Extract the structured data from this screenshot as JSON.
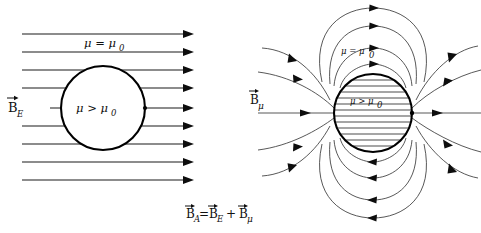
{
  "figure": {
    "background_color": "#ffffff",
    "line_color": "#1a1a1a",
    "thin_line_color": "#3a3a3a",
    "sphere_stroke_color": "#000000"
  },
  "left_panel": {
    "name": "external-uniform-field-panel",
    "field_label": {
      "symbol": "B",
      "subscript": "E",
      "vector_arrow": "→",
      "full": "B⃗E"
    },
    "outside_medium_label": "μ = μ",
    "outside_medium_subscript": "0",
    "outside_medium_full": "μ = μ₀",
    "inside_medium_label": "μ > μ",
    "inside_medium_subscript": "0",
    "inside_medium_full": "μ > μ₀",
    "field_line_count": 9,
    "field_direction": "left-to-right",
    "sphere": {
      "cx": 103,
      "cy": 108,
      "r": 42
    }
  },
  "right_panel": {
    "name": "magnetization-dipole-field-panel",
    "field_label": {
      "symbol": "B",
      "subscript": "μ",
      "vector_arrow": "→",
      "full": "B⃗μ"
    },
    "outside_medium_label": "μ = μ",
    "outside_medium_subscript": "0",
    "outside_medium_full": "μ = μ₀",
    "inside_medium_label": "μ > μ",
    "inside_medium_subscript": "0",
    "inside_medium_full": "μ > μ₀",
    "field_pattern": "dipole",
    "sphere": {
      "cx": 373,
      "cy": 113,
      "r": 39
    },
    "sphere_fill": "horizontal-hatching"
  },
  "equation": {
    "name": "superposition-equation",
    "parts": {
      "lhs_symbol": "B",
      "lhs_subscript": "A",
      "equals": "=",
      "term1_symbol": "B",
      "term1_subscript": "E",
      "plus": "+",
      "term2_symbol": "B",
      "term2_subscript": "μ"
    },
    "full": "B⃗A = B⃗E + B⃗μ"
  }
}
